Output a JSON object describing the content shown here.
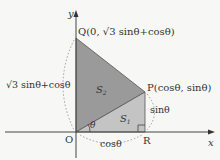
{
  "diagram": {
    "axes": {
      "x_label": "x",
      "y_label": "y"
    },
    "points": {
      "O": {
        "label": "O"
      },
      "Q": {
        "label": "Q",
        "coords": "(0, √3 sinθ+cosθ)"
      },
      "P": {
        "label": "P",
        "coords": "(cosθ, sinθ)"
      },
      "R": {
        "label": "R"
      }
    },
    "regions": {
      "S1": {
        "label": "S",
        "sub": "1",
        "color": "#bdbdbd"
      },
      "S2": {
        "label": "S",
        "sub": "2",
        "color": "#9a9a9a"
      }
    },
    "measures": {
      "oq": "√3 sinθ+cosθ",
      "pr": "sinθ",
      "or": "cosθ",
      "angle": "θ"
    },
    "colors": {
      "axis": "#444444",
      "edge": "#555555",
      "dashed": "#888888",
      "background": "#f7f7f5"
    }
  }
}
